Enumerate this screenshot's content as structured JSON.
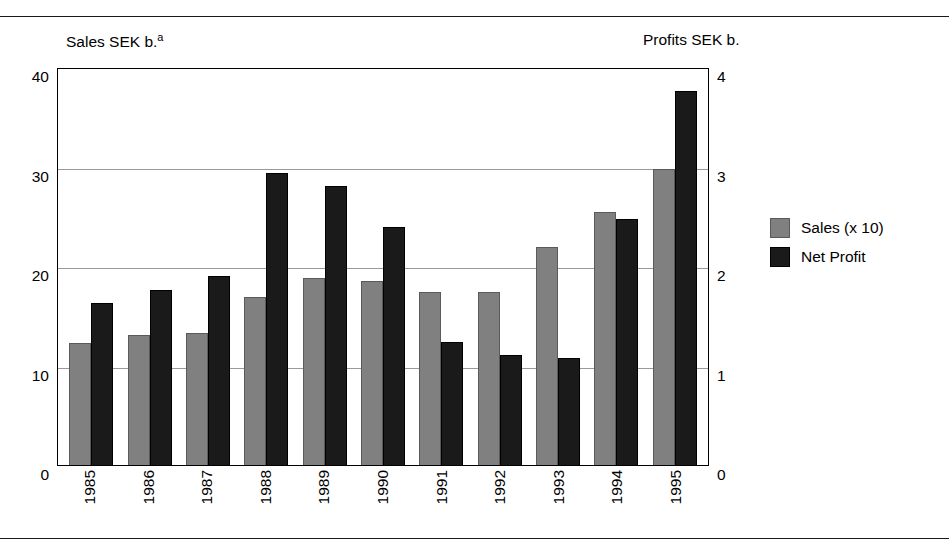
{
  "chart_data": {
    "type": "bar",
    "title": "",
    "left_axis_title": "Sales SEK b.",
    "left_axis_title_superscript": "a",
    "right_axis_title": "Profits SEK b.",
    "xlabel": "",
    "categories": [
      "1985",
      "1986",
      "1987",
      "1988",
      "1989",
      "1990",
      "1991",
      "1992",
      "1993",
      "1994",
      "1995"
    ],
    "left_ticks": [
      "40",
      "30",
      "20",
      "10",
      "0"
    ],
    "right_ticks": [
      "4",
      "3",
      "2",
      "1",
      "0"
    ],
    "ylim": [
      0,
      40
    ],
    "y2lim": [
      0,
      4
    ],
    "grid": true,
    "legend_position": "right",
    "series": [
      {
        "name": "Sales (x 10)",
        "axis": "left",
        "color": "#808080",
        "values": [
          12.3,
          13.1,
          13.3,
          16.9,
          18.8,
          18.5,
          17.4,
          17.4,
          21.9,
          25.4,
          29.8
        ]
      },
      {
        "name": "Net Profit",
        "axis": "right",
        "color": "#1a1a1a",
        "values": [
          1.63,
          1.76,
          1.9,
          2.94,
          2.8,
          2.39,
          1.24,
          1.11,
          1.08,
          2.47,
          3.76
        ]
      }
    ]
  },
  "legend": {
    "items": [
      {
        "label": "Sales (x 10)",
        "swatch": "sales"
      },
      {
        "label": "Net Profit",
        "swatch": "profit"
      }
    ]
  }
}
